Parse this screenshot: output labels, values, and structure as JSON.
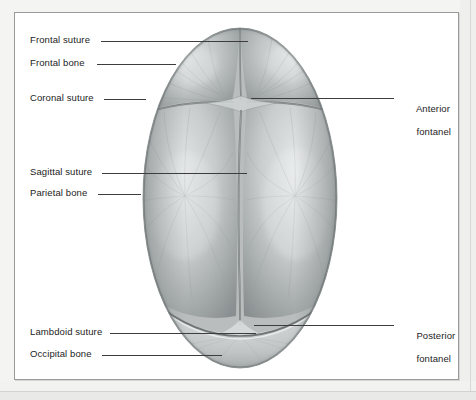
{
  "figure": {
    "view": "superior",
    "background_color": "#ffffff",
    "page_color": "#f3f3f2",
    "panel_border_color": "#9a9a9a",
    "leader_line_color": "#3d3d3d",
    "label_text_color": "#1d1d1d",
    "bone_fill_color": "#b9bdbd",
    "suture_color": "#7c8182"
  },
  "labels": {
    "left": [
      {
        "id": "frontal-suture",
        "text": "Frontal suture",
        "x": 30,
        "y": 34,
        "leader": {
          "x1": 101,
          "x2": 248,
          "y": 41
        }
      },
      {
        "id": "frontal-bone",
        "text": "Frontal bone",
        "x": 30,
        "y": 57,
        "leader": {
          "x1": 97,
          "x2": 176,
          "y": 64
        }
      },
      {
        "id": "coronal-suture",
        "text": "Coronal suture",
        "x": 30,
        "y": 92,
        "leader": {
          "x1": 104,
          "x2": 146,
          "y": 99
        }
      },
      {
        "id": "sagittal-suture",
        "text": "Sagittal suture",
        "x": 30,
        "y": 166,
        "leader": {
          "x1": 102,
          "x2": 247,
          "y": 173
        }
      },
      {
        "id": "parietal-bone",
        "text": "Parietal bone",
        "x": 30,
        "y": 187,
        "leader": {
          "x1": 98,
          "x2": 141,
          "y": 194
        }
      },
      {
        "id": "lambdoid-suture",
        "text": "Lambdoid suture",
        "x": 30,
        "y": 326,
        "leader": {
          "x1": 110,
          "x2": 256,
          "y": 333
        }
      },
      {
        "id": "occipital-bone",
        "text": "Occipital bone",
        "x": 30,
        "y": 348,
        "leader": {
          "x1": 102,
          "x2": 222,
          "y": 355
        }
      }
    ],
    "right": [
      {
        "id": "anterior-fontanel",
        "line1": "Anterior",
        "line2": "fontanel",
        "x": 400,
        "y": 91,
        "leader": {
          "x1": 251,
          "x2": 394,
          "y": 98
        }
      },
      {
        "id": "posterior-fontanel",
        "line1": "Posterior",
        "line2": "fontanel",
        "x": 400,
        "y": 318,
        "leader": {
          "x1": 254,
          "x2": 394,
          "y": 325
        }
      }
    ]
  },
  "anatomy": {
    "bones": [
      {
        "name": "Left frontal bone",
        "region": "anterior-left"
      },
      {
        "name": "Right frontal bone",
        "region": "anterior-right"
      },
      {
        "name": "Left parietal bone",
        "region": "posterior-left"
      },
      {
        "name": "Right parietal bone",
        "region": "posterior-right"
      },
      {
        "name": "Occipital bone",
        "region": "posterior-inferior"
      }
    ],
    "sutures": [
      "Frontal suture",
      "Coronal suture",
      "Sagittal suture",
      "Lambdoid suture"
    ],
    "fontanels": [
      "Anterior fontanel",
      "Posterior fontanel"
    ]
  }
}
